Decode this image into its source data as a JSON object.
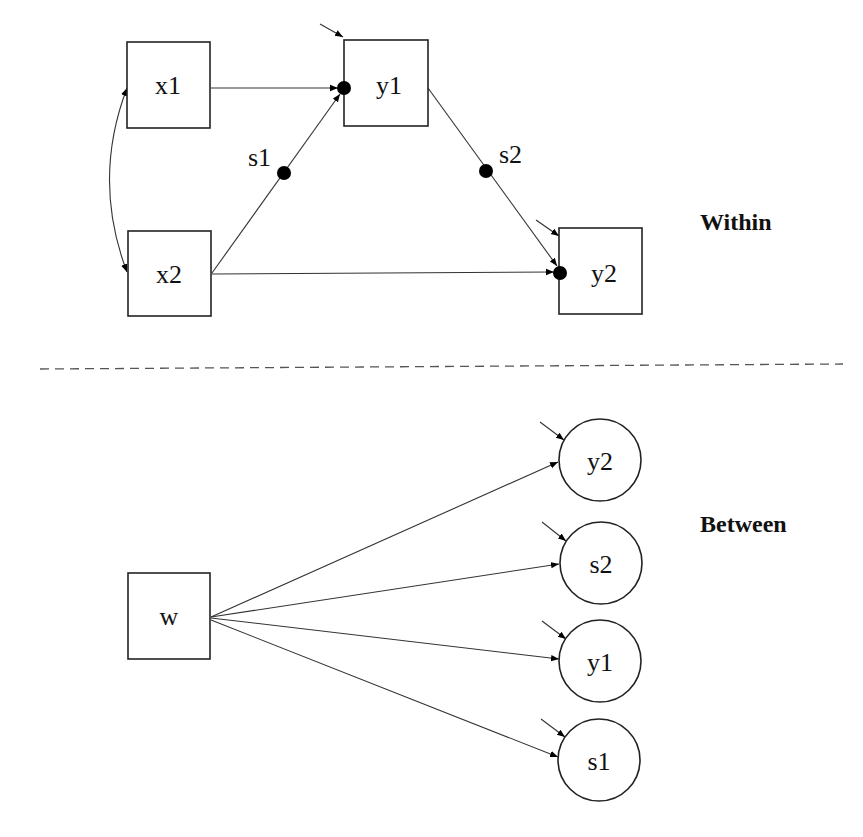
{
  "diagram": {
    "type": "multilevel path diagram",
    "sections": {
      "within": {
        "label": "Within",
        "nodes": [
          {
            "id": "x1",
            "label": "x1",
            "shape": "box"
          },
          {
            "id": "x2",
            "label": "x2",
            "shape": "box"
          },
          {
            "id": "y1",
            "label": "y1",
            "shape": "box"
          },
          {
            "id": "y2",
            "label": "y2",
            "shape": "box"
          }
        ],
        "random_slopes": [
          {
            "id": "s1",
            "label": "s1",
            "path": "x2 -> y1"
          },
          {
            "id": "s2",
            "label": "s2",
            "path": "y1 -> y2"
          }
        ],
        "edges": [
          {
            "from": "x1",
            "to": "y1",
            "type": "directed"
          },
          {
            "from": "x2",
            "to": "y1",
            "type": "directed",
            "random_slope": "s1"
          },
          {
            "from": "y1",
            "to": "y2",
            "type": "directed",
            "random_slope": "s2"
          },
          {
            "from": "x2",
            "to": "y2",
            "type": "directed"
          },
          {
            "from": "x1",
            "to": "x2",
            "type": "covariance"
          }
        ],
        "residuals": [
          "y1",
          "y2"
        ]
      },
      "between": {
        "label": "Between",
        "nodes": [
          {
            "id": "w",
            "label": "w",
            "shape": "box"
          },
          {
            "id": "y2b",
            "label": "y2",
            "shape": "circle"
          },
          {
            "id": "s2b",
            "label": "s2",
            "shape": "circle"
          },
          {
            "id": "y1b",
            "label": "y1",
            "shape": "circle"
          },
          {
            "id": "s1b",
            "label": "s1",
            "shape": "circle"
          }
        ],
        "edges": [
          {
            "from": "w",
            "to": "y2",
            "type": "directed"
          },
          {
            "from": "w",
            "to": "s2",
            "type": "directed"
          },
          {
            "from": "w",
            "to": "y1",
            "type": "directed"
          },
          {
            "from": "w",
            "to": "s1",
            "type": "directed"
          }
        ],
        "residuals": [
          "y2",
          "s2",
          "y1",
          "s1"
        ]
      }
    }
  }
}
